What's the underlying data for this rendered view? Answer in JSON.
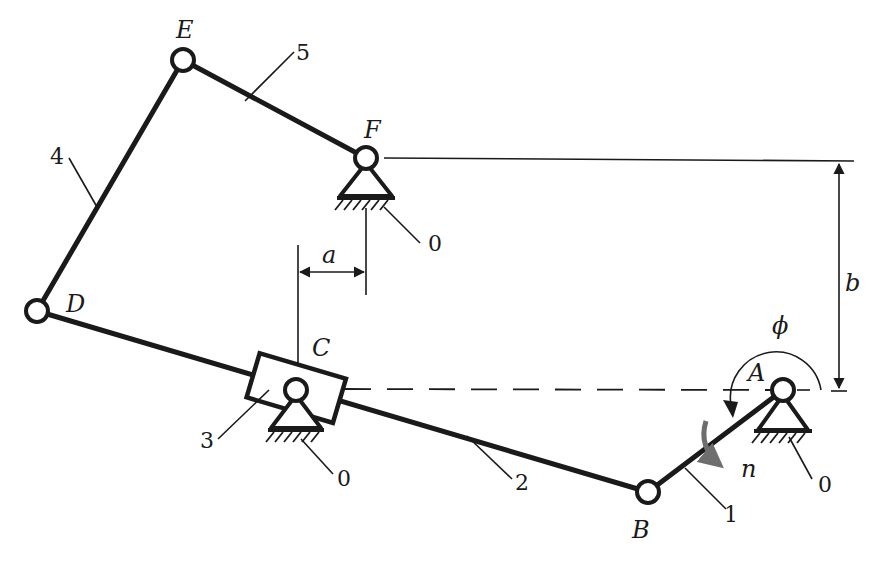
{
  "diagram": {
    "type": "planar linkage mechanism (six-bar with slider)",
    "joints": {
      "A": {
        "label": "A",
        "x": 783,
        "y": 390
      },
      "B": {
        "label": "B",
        "x": 648,
        "y": 492
      },
      "C": {
        "label": "C",
        "x": 296,
        "y": 390
      },
      "D": {
        "label": "D",
        "x": 37,
        "y": 311
      },
      "E": {
        "label": "E",
        "x": 183,
        "y": 60
      },
      "F": {
        "label": "F",
        "x": 366,
        "y": 158
      }
    },
    "links": [
      {
        "id": "1",
        "label": "1",
        "from": "A",
        "to": "B"
      },
      {
        "id": "2",
        "label": "2",
        "from": "B",
        "to": "D"
      },
      {
        "id": "3",
        "label": "3",
        "desc": "slider block at C"
      },
      {
        "id": "4",
        "label": "4",
        "from": "D",
        "to": "E"
      },
      {
        "id": "5",
        "label": "5",
        "from": "E",
        "to": "F"
      }
    ],
    "ground_labels": [
      "0",
      "0",
      "0",
      "0"
    ],
    "dimensions": {
      "a": {
        "label": "a"
      },
      "b": {
        "label": "b"
      },
      "phi": {
        "label": "ϕ"
      }
    },
    "rotation": {
      "label": "n",
      "color": "#6e6e6e"
    }
  },
  "labels": {
    "A": "A",
    "B": "B",
    "C": "C",
    "D": "D",
    "E": "E",
    "F": "F",
    "n1": "1",
    "n2": "2",
    "n3": "3",
    "n4": "4",
    "n5": "5",
    "g_F": "0",
    "g_C": "0",
    "g_A": "0",
    "a": "a",
    "b": "b",
    "phi": "ϕ",
    "n": "n"
  },
  "colors": {
    "ink": "#1a1a1a",
    "arrow_gray": "#6e6e6e",
    "background": "#ffffff"
  }
}
